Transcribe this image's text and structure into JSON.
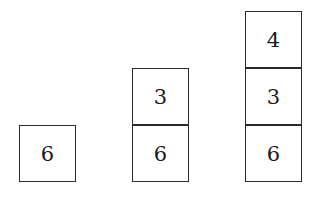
{
  "diagram": {
    "stacks": [
      {
        "boxes": [
          "6"
        ]
      },
      {
        "boxes": [
          "3",
          "6"
        ]
      },
      {
        "boxes": [
          "4",
          "3",
          "6"
        ]
      }
    ]
  }
}
